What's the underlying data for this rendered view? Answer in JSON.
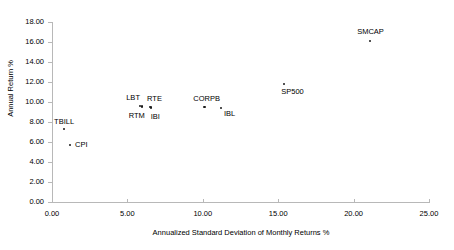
{
  "chart_data": {
    "type": "scatter",
    "title": "",
    "xlabel": "Annualized Standard Deviation of Monthly Returns %",
    "ylabel": "Annual Return %",
    "xlim": [
      0,
      25
    ],
    "ylim": [
      0,
      18
    ],
    "grid": false,
    "legend": "none",
    "xticks": [
      "0.00",
      "5.00",
      "10.00",
      "15.00",
      "20.00",
      "25.00"
    ],
    "xtick_values": [
      0,
      5,
      10,
      15,
      20,
      25
    ],
    "yticks": [
      "0.00",
      "2.00",
      "4.00",
      "6.00",
      "8.00",
      "10.00",
      "12.00",
      "14.00",
      "16.00",
      "18.00"
    ],
    "ytick_values": [
      0,
      2,
      4,
      6,
      8,
      10,
      12,
      14,
      16,
      18
    ],
    "points": [
      {
        "label": "TBILL",
        "x": 0.8,
        "y": 7.3,
        "label_dx": -10,
        "label_dy": -11
      },
      {
        "label": "CPI",
        "x": 1.2,
        "y": 5.7,
        "label_dx": 5,
        "label_dy": -4
      },
      {
        "label": "LBT",
        "x": 5.85,
        "y": 9.6,
        "label_dx": -14,
        "label_dy": -12
      },
      {
        "label": "RTM",
        "x": 5.95,
        "y": 9.55,
        "label_dx": -13,
        "label_dy": 5
      },
      {
        "label": "RTE",
        "x": 6.5,
        "y": 9.5,
        "label_dx": -3,
        "label_dy": -12
      },
      {
        "label": "IBI",
        "x": 6.55,
        "y": 9.45,
        "label_dx": 0,
        "label_dy": 5
      },
      {
        "label": "CORPB",
        "x": 10.1,
        "y": 9.5,
        "label_dx": -11,
        "label_dy": -12
      },
      {
        "label": "IBL",
        "x": 11.2,
        "y": 9.4,
        "label_dx": 3,
        "label_dy": 2
      },
      {
        "label": "SP500",
        "x": 15.4,
        "y": 11.8,
        "label_dx": -3,
        "label_dy": 4
      },
      {
        "label": "SMCAP",
        "x": 21.1,
        "y": 16.1,
        "label_dx": -13,
        "label_dy": -13
      }
    ],
    "colors": {
      "point": "#1a1a1a",
      "axis": "#b8b8b8",
      "text": "#000000",
      "background": "#ffffff"
    }
  }
}
